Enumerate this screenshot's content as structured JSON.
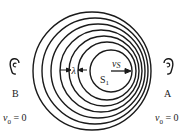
{
  "diagram": {
    "colors": {
      "stroke": "#1a1a1a",
      "background": "#ffffff"
    },
    "wavefronts": {
      "count": 7,
      "circles": [
        {
          "cx": 92,
          "cy": 71,
          "r": 59
        },
        {
          "cx": 95,
          "cy": 71,
          "r": 53
        },
        {
          "cx": 98,
          "cy": 71,
          "r": 47
        },
        {
          "cx": 101,
          "cy": 71,
          "r": 41
        },
        {
          "cx": 104,
          "cy": 71,
          "r": 35
        },
        {
          "cx": 107,
          "cy": 71,
          "r": 29
        },
        {
          "cx": 111,
          "cy": 71,
          "r": 21
        }
      ]
    },
    "source": {
      "label_main": "S",
      "label_sub": "1"
    },
    "source_velocity": {
      "label": "vS"
    },
    "wavelength": {
      "label": "λ"
    },
    "observer_left": {
      "icon": "ear-icon-left",
      "glyph": "℮",
      "label": "B",
      "velocity_var": "v",
      "velocity_sub": "0",
      "velocity_value": "= 0"
    },
    "observer_right": {
      "icon": "ear-icon-right",
      "glyph": "϶",
      "label": "A",
      "velocity_var": "v",
      "velocity_sub": "0",
      "velocity_value": "= 0"
    }
  }
}
